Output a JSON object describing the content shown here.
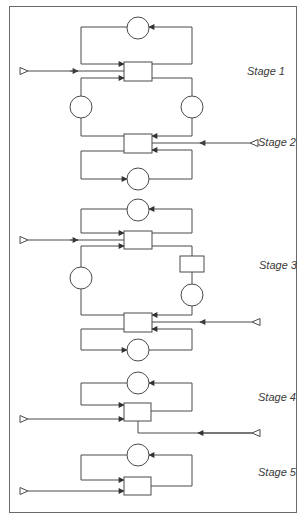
{
  "diagram": {
    "type": "multi-stage flow diagram",
    "stages": [
      {
        "label": "Stage 1",
        "elements": [
          "top feedback loop with circle",
          "mixer box with 3 inputs",
          "left circle branch",
          "right circle branch"
        ]
      },
      {
        "label": "Stage 2",
        "elements": [
          "mixer box with external input from right",
          "bottom feedback loop with circle"
        ]
      },
      {
        "label": "Stage 3",
        "elements": [
          "top feedback loop with circle",
          "mixer box with external input from left",
          "left circle branch",
          "right box + circle branch",
          "lower mixer box with external input from right",
          "bottom feedback loop with circle"
        ]
      },
      {
        "label": "Stage 4",
        "elements": [
          "top feedback loop with circle",
          "mixer box with external input from left",
          "output line to right with input arrow"
        ]
      },
      {
        "label": "Stage 5",
        "elements": [
          "top feedback loop with circle",
          "mixer box with external input from left"
        ]
      }
    ],
    "colors": {
      "line": "#4a4a4a",
      "background": "#ffffff",
      "frame": "#6a6a6a"
    }
  }
}
